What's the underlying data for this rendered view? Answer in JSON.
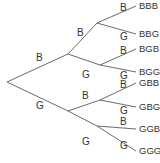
{
  "diagram": {
    "type": "probability-tree",
    "root": {
      "x": 7,
      "y": 82
    },
    "level1": [
      {
        "id": "B",
        "label": "B",
        "x": 68,
        "y": 54,
        "label_x": 36,
        "label_y": 61
      },
      {
        "id": "G",
        "label": "G",
        "x": 68,
        "y": 111,
        "label_x": 36,
        "label_y": 109
      }
    ],
    "level2": [
      {
        "id": "BB",
        "parent": "B",
        "label": "B",
        "x": 97,
        "y": 23,
        "label_x": 77,
        "label_y": 36
      },
      {
        "id": "BG",
        "parent": "B",
        "label": "G",
        "x": 100,
        "y": 65,
        "label_x": 82,
        "label_y": 78
      },
      {
        "id": "GB",
        "parent": "G",
        "label": "B",
        "x": 100,
        "y": 100,
        "label_x": 82,
        "label_y": 99
      },
      {
        "id": "GG",
        "parent": "G",
        "label": "G",
        "x": 97,
        "y": 126,
        "label_x": 82,
        "label_y": 145
      }
    ],
    "leaves": [
      {
        "parent": "BB",
        "branch": "B",
        "text": "BBB",
        "y": 9,
        "branch_label_y": 11
      },
      {
        "parent": "BB",
        "branch": "G",
        "text": "BBG",
        "y": 37,
        "branch_label_y": 40
      },
      {
        "parent": "BG",
        "branch": "B",
        "text": "BGB",
        "y": 52,
        "branch_label_y": 54
      },
      {
        "parent": "BG",
        "branch": "G",
        "text": "BGG",
        "y": 75,
        "branch_label_y": 79
      },
      {
        "parent": "GB",
        "branch": "B",
        "text": "GBB",
        "y": 86,
        "branch_label_y": 88
      },
      {
        "parent": "GB",
        "branch": "G",
        "text": "GBG",
        "y": 110,
        "branch_label_y": 114
      },
      {
        "parent": "GG",
        "branch": "B",
        "text": "GGB",
        "y": 132,
        "branch_label_y": 125
      },
      {
        "parent": "GG",
        "branch": "G",
        "text": "GGG",
        "y": 154,
        "branch_label_y": 149
      }
    ],
    "leaf_line_end_x": 136,
    "leaf_text_x": 139,
    "branch_label_x": 120
  }
}
